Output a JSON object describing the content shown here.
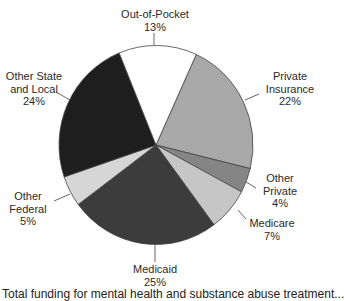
{
  "chart_data": {
    "type": "pie",
    "title": "",
    "start_angle_deg": 24.5,
    "direction": "clockwise",
    "slices": [
      {
        "label": "Private Insurance",
        "label_lines": [
          "Private",
          "Insurance"
        ],
        "value": 22,
        "value_label": "22%",
        "color": "#a8a8a8"
      },
      {
        "label": "Other Private",
        "label_lines": [
          "Other",
          "Private"
        ],
        "value": 4,
        "value_label": "4%",
        "color": "#858585"
      },
      {
        "label": "Medicare",
        "label_lines": [
          "Medicare"
        ],
        "value": 7,
        "value_label": "7%",
        "color": "#c6c6c6"
      },
      {
        "label": "Medicaid",
        "label_lines": [
          "Medicaid"
        ],
        "value": 25,
        "value_label": "25%",
        "color": "#3c3c3c"
      },
      {
        "label": "Other Federal",
        "label_lines": [
          "Other",
          "Federal"
        ],
        "value": 5,
        "value_label": "5%",
        "color": "#d6d6d6"
      },
      {
        "label": "Other State and Local",
        "label_lines": [
          "Other State",
          "and Local"
        ],
        "value": 24,
        "value_label": "24%",
        "color": "#1e1e1e"
      },
      {
        "label": "Out-of-Pocket",
        "label_lines": [
          "Out-of-Pocket"
        ],
        "value": 13,
        "value_label": "13%",
        "color": "#ffffff"
      }
    ],
    "legend": "none (direct labels with leader lines)"
  },
  "caption": "Total funding for mental health and substance abuse treatment..."
}
